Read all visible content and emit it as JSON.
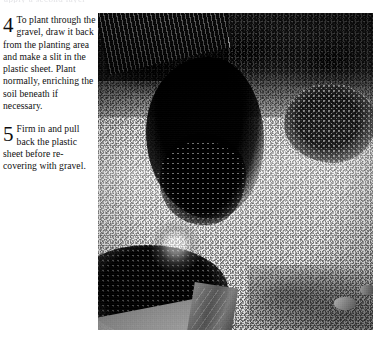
{
  "page": {
    "background_color": "#ffffff",
    "text_color": "#100f10",
    "clipped_top_fragment": "apply a second layer"
  },
  "steps": [
    {
      "number": "4",
      "lead": "To plant",
      "body": "through the gravel, draw it back from the planting area and make a slit in the plastic sheet. Plant normally, enriching the soil beneath if necessary."
    },
    {
      "number": "5",
      "lead": "Firm in and",
      "body": "pull back the plastic sheet before re-covering with gravel."
    }
  ],
  "photo": {
    "caption": "",
    "alt": "Black and white photograph of a gravel garden bed with dark shrubs, a wooden fence at the upper left, and stone edging in the lower left",
    "type": "grayscale-photograph",
    "elements": [
      "wooden-fence",
      "dark-hedge",
      "central-shrub",
      "gravel-bed",
      "right-shrub",
      "stone-slab",
      "garden-path"
    ]
  }
}
